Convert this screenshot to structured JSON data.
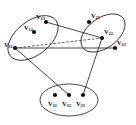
{
  "figure": {
    "type": "graph-diagram",
    "stroke_color": "#1a1a1a",
    "vertex_color": "#111111",
    "background": "#ffffff"
  },
  "groups": [
    {
      "id": "group-left",
      "name": "left-ellipse",
      "cx": 33,
      "cy": 38,
      "rx": 29,
      "ry": 17,
      "rotate": -38
    },
    {
      "id": "group-right",
      "name": "right-ellipse",
      "cx": 103,
      "cy": 33,
      "rx": 25,
      "ry": 15,
      "rotate": -36
    },
    {
      "id": "group-bottom",
      "name": "bottom-ellipse",
      "cx": 69,
      "cy": 100,
      "rx": 29,
      "ry": 16,
      "rotate": 0
    }
  ],
  "vertices": [
    {
      "id": "v11",
      "label": "V",
      "sub": "11",
      "group": "group-left",
      "x": 15,
      "y": 48,
      "lx": 4,
      "ly": 42
    },
    {
      "id": "v12",
      "label": "V",
      "sub": "12",
      "group": "group-left",
      "x": 34,
      "y": 32,
      "lx": 24,
      "ly": 25
    },
    {
      "id": "v13",
      "label": "V",
      "sub": "13",
      "group": "group-left",
      "x": 46,
      "y": 22,
      "lx": 36,
      "ly": 14
    },
    {
      "id": "v21",
      "label": "V",
      "sub": "21",
      "group": "group-right",
      "x": 89,
      "y": 22,
      "lx": 91,
      "ly": 13
    },
    {
      "id": "v22",
      "label": "V",
      "sub": "22",
      "group": "group-right",
      "x": 102,
      "y": 38,
      "lx": 104,
      "ly": 29
    },
    {
      "id": "v23",
      "label": "V",
      "sub": "23",
      "group": "group-right",
      "x": 115,
      "y": 48,
      "lx": 117,
      "ly": 40
    },
    {
      "id": "v31",
      "label": "V",
      "sub": "31",
      "group": "group-bottom",
      "x": 55,
      "y": 95,
      "lx": 48,
      "ly": 101
    },
    {
      "id": "v32",
      "label": "V",
      "sub": "32",
      "group": "group-bottom",
      "x": 69,
      "y": 95,
      "lx": 62,
      "ly": 101
    },
    {
      "id": "v33",
      "label": "V",
      "sub": "33",
      "group": "group-bottom",
      "x": 83,
      "y": 95,
      "lx": 76,
      "ly": 101
    }
  ],
  "edges": [
    {
      "id": "e1",
      "from": "v13",
      "to": "v22",
      "style": "solid"
    },
    {
      "id": "e2",
      "from": "v11",
      "to": "v22",
      "style": "dashed"
    },
    {
      "id": "e3",
      "from": "v11",
      "to": "v23",
      "style": "solid"
    },
    {
      "id": "e4",
      "from": "v11",
      "to": "v32",
      "style": "solid"
    },
    {
      "id": "e5",
      "from": "v22",
      "to": "v33",
      "style": "solid"
    }
  ]
}
